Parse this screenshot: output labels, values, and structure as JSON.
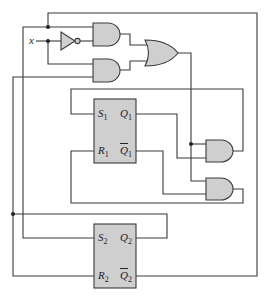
{
  "diagram": {
    "input_label": "x",
    "flipflops": [
      {
        "id": "ff1",
        "s": "S",
        "s_sub": "1",
        "r": "R",
        "r_sub": "1",
        "q": "Q",
        "q_sub": "1",
        "qbar": "Q",
        "qbar_sub": "1"
      },
      {
        "id": "ff2",
        "s": "S",
        "s_sub": "2",
        "r": "R",
        "r_sub": "2",
        "q": "Q",
        "q_sub": "2",
        "qbar": "Q",
        "qbar_sub": "2"
      }
    ],
    "gates": [
      "NOT",
      "AND",
      "AND",
      "OR",
      "AND",
      "AND"
    ],
    "colors": {
      "gate_fill": "#cfcfcf",
      "wire": "#3a3a3a"
    }
  }
}
